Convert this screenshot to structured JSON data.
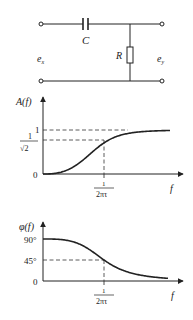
{
  "circuit": {
    "capacitor_label": "C",
    "resistor_label": "R",
    "input_label": "e",
    "input_sub": "x",
    "output_label": "e",
    "output_sub": "y"
  },
  "chart_data": [
    {
      "type": "line",
      "title": "Amplitude response of RC high-pass filter",
      "ylabel": "A(f)",
      "xlabel": "f",
      "ytick_labels": [
        "0",
        "1/√2",
        "1"
      ],
      "xtick_labels": [
        "1/2πτ"
      ],
      "cutoff_label_num": "1",
      "cutoff_label_den": "2πτ",
      "y_one_label": "1",
      "y_half_num": "1",
      "y_half_den": "√2",
      "origin_label": "0",
      "curve": "A(f) = 1/sqrt(1+(1/(2πfτ))^2); rises from 0 to 1, equals 1/√2 at f = 1/2πτ",
      "key_points": [
        {
          "x": "0",
          "y": 0
        },
        {
          "x": "1/2πτ",
          "y": 0.7071
        },
        {
          "x": "high f",
          "y": 1
        }
      ],
      "ylim": [
        0,
        1
      ]
    },
    {
      "type": "line",
      "title": "Phase response of RC high-pass filter",
      "ylabel": "φ(f)",
      "xlabel": "f",
      "ytick_labels": [
        "0",
        "45°",
        "90°"
      ],
      "xtick_labels": [
        "1/2πτ"
      ],
      "cutoff_label_num": "1",
      "cutoff_label_den": "2πτ",
      "y90_label": "90°",
      "y45_label": "45°",
      "origin_label": "0",
      "curve": "φ(f) = arctan(1/(2πfτ)); falls from 90° to 0°, equals 45° at f = 1/2πτ",
      "key_points": [
        {
          "x": "0",
          "y": 90
        },
        {
          "x": "1/2πτ",
          "y": 45
        },
        {
          "x": "high f",
          "y": 0
        }
      ],
      "ylim": [
        0,
        90
      ]
    }
  ]
}
